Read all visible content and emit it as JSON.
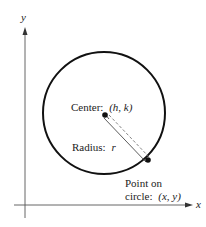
{
  "diagram": {
    "axes": {
      "x_label": "x",
      "y_label": "y"
    },
    "labels": {
      "center_prefix": "Center:",
      "center_coords": "(h,  k)",
      "radius_prefix": "Radius:",
      "radius_symbol": "r",
      "point_line1": "Point on",
      "point_prefix": "circle:",
      "point_coords": "(x,  y)"
    },
    "geometry": {
      "circle_center": [
        104,
        113
      ],
      "circle_radius": 61,
      "center_point": [
        105,
        115
      ],
      "point_on_circle": [
        148,
        160
      ]
    },
    "colors": {
      "stroke": "#111111",
      "axis": "#555555",
      "dash": "#666666"
    }
  }
}
